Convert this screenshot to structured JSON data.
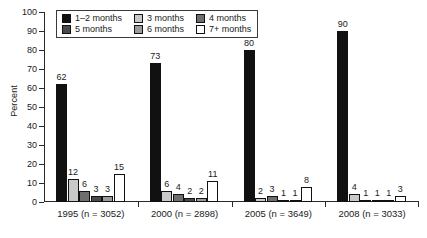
{
  "chart_data": {
    "type": "bar",
    "title": "",
    "subtitle": "",
    "xlabel": "",
    "ylabel": "Percent",
    "ylim": [
      0,
      100
    ],
    "y_ticks": [
      0,
      10,
      20,
      30,
      40,
      50,
      60,
      70,
      80,
      90,
      100
    ],
    "grid": false,
    "legend_position": "top-center-inside",
    "categories": [
      "1995 (n = 3052)",
      "2000 (n = 2898)",
      "2005 (n = 3649)",
      "2008 (n = 3033)"
    ],
    "series": [
      {
        "name": "1–2 months",
        "color": "#111111",
        "values": [
          62,
          73,
          80,
          90
        ]
      },
      {
        "name": "3 months",
        "color": "#c9c9c9",
        "values": [
          12,
          6,
          2,
          4
        ]
      },
      {
        "name": "4 months",
        "color": "#6e6e6e",
        "values": [
          6,
          4,
          3,
          1
        ]
      },
      {
        "name": "5 months",
        "color": "#4a4a4a",
        "values": [
          3,
          2,
          1,
          1
        ]
      },
      {
        "name": "6 months",
        "color": "#9a9a9a",
        "values": [
          3,
          2,
          1,
          1
        ]
      },
      {
        "name": "7+ months",
        "color": "#ffffff",
        "values": [
          15,
          11,
          8,
          3
        ]
      }
    ],
    "data_labels": [
      [
        62,
        12,
        6,
        3,
        3,
        15
      ],
      [
        73,
        6,
        4,
        2,
        2,
        11
      ],
      [
        80,
        2,
        3,
        1,
        1,
        8
      ],
      [
        90,
        4,
        1,
        1,
        1,
        3
      ]
    ]
  },
  "legend": {
    "items": [
      {
        "label": "1–2 months"
      },
      {
        "label": "3 months"
      },
      {
        "label": "4 months"
      },
      {
        "label": "5 months"
      },
      {
        "label": "6 months"
      },
      {
        "label": "7+ months"
      }
    ]
  },
  "axes": {
    "y_title": "Percent",
    "y_tick_labels": [
      "100",
      "90",
      "80",
      "70",
      "60",
      "50",
      "40",
      "30",
      "20",
      "10",
      "0"
    ],
    "x_tick_labels": [
      "1995 (n = 3052)",
      "2000 (n = 2898)",
      "2005 (n = 3649)",
      "2008 (n = 3033)"
    ]
  }
}
